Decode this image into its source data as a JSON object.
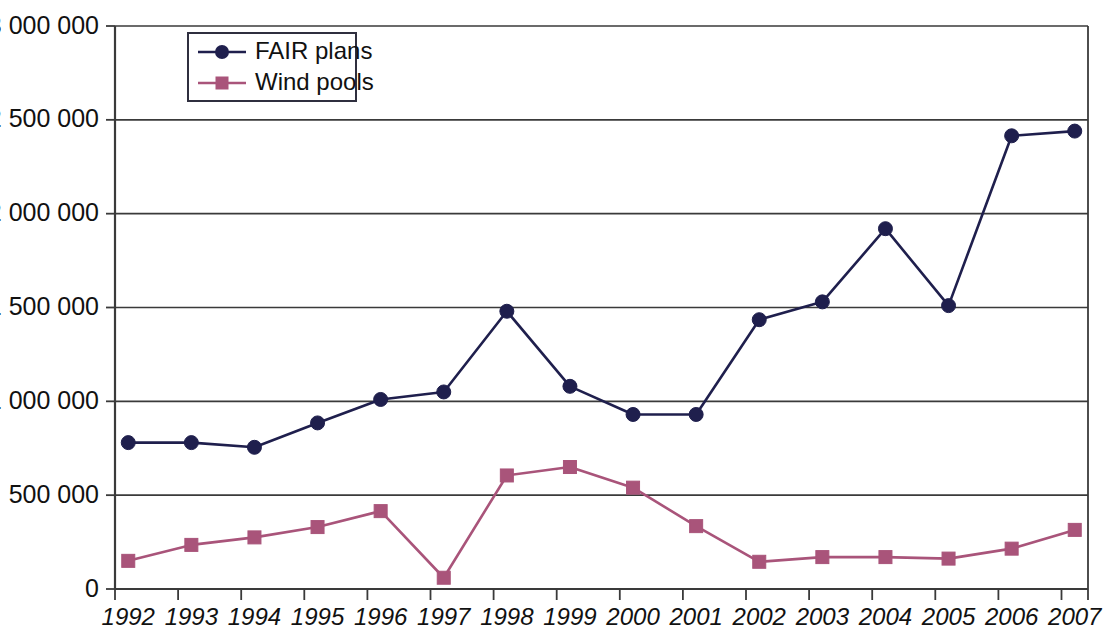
{
  "chart_data": {
    "type": "line",
    "title": "",
    "subtitle": "",
    "xlabel": "",
    "ylabel": "",
    "categories": [
      "1992",
      "1993",
      "1994",
      "1995",
      "1996",
      "1997",
      "1998",
      "1999",
      "2000",
      "2001",
      "2002",
      "2003",
      "2004",
      "2005",
      "2006",
      "2007"
    ],
    "series": [
      {
        "name": "FAIR plans",
        "color": "#1f1f4d",
        "marker": "circle",
        "values": [
          780000,
          780000,
          755000,
          885000,
          1010000,
          1050000,
          1480000,
          1080000,
          930000,
          930000,
          1435000,
          1530000,
          1920000,
          1510000,
          2415000,
          2440000
        ]
      },
      {
        "name": "Wind pools",
        "color": "#a9547a",
        "marker": "square",
        "values": [
          150000,
          235000,
          275000,
          330000,
          415000,
          60000,
          605000,
          650000,
          540000,
          335000,
          145000,
          170000,
          170000,
          162000,
          215000,
          315000
        ]
      }
    ],
    "ylim": [
      0,
      3000000
    ],
    "ytick_values": [
      0,
      500000,
      1000000,
      1500000,
      2000000,
      2500000,
      3000000
    ],
    "ytick_labels": [
      "0",
      "500 000",
      "1 000 000",
      "1 500 000",
      "2 000 000",
      "2 500 000",
      "3 000 000"
    ],
    "grid": true,
    "grid_axis": "y",
    "legend_position": "top-left-inside"
  },
  "legend": {
    "entries": [
      {
        "label": "FAIR plans",
        "icon": "circle-marker-icon"
      },
      {
        "label": "Wind pools",
        "icon": "square-marker-icon"
      }
    ]
  },
  "axes": {
    "y_labels": [
      "3 000 000",
      "2 500 000",
      "2 000 000",
      "1 500 000",
      "1 000 000",
      "500 000",
      "0"
    ],
    "x_labels": [
      "1992",
      "1993",
      "1994",
      "1995",
      "1996",
      "1997",
      "1998",
      "1999",
      "2000",
      "2001",
      "2002",
      "2003",
      "2004",
      "2005",
      "2006",
      "2007"
    ]
  },
  "colors": {
    "fair_plans": "#1f1f4d",
    "wind_pools": "#a9547a",
    "axis": "#3a3a3a",
    "background": "#ffffff",
    "text": "#111111"
  }
}
